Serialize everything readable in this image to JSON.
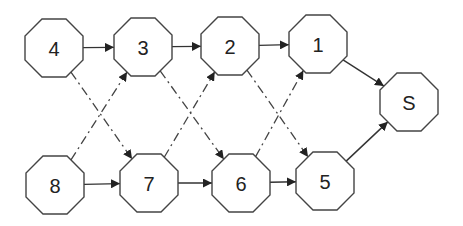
{
  "diagram": {
    "title": "",
    "nodes": [
      {
        "id": "4",
        "label": "4",
        "cx": 54,
        "cy": 48
      },
      {
        "id": "3",
        "label": "3",
        "cx": 143,
        "cy": 47
      },
      {
        "id": "2",
        "label": "2",
        "cx": 230,
        "cy": 46
      },
      {
        "id": "1",
        "label": "1",
        "cx": 318,
        "cy": 44
      },
      {
        "id": "S",
        "label": "S",
        "cx": 409,
        "cy": 102
      },
      {
        "id": "8",
        "label": "8",
        "cx": 55,
        "cy": 185
      },
      {
        "id": "7",
        "label": "7",
        "cx": 149,
        "cy": 183
      },
      {
        "id": "6",
        "label": "6",
        "cx": 241,
        "cy": 183
      },
      {
        "id": "5",
        "label": "5",
        "cx": 325,
        "cy": 181
      }
    ],
    "edges": [
      {
        "from": "4",
        "to": "3",
        "style": "solid"
      },
      {
        "from": "3",
        "to": "2",
        "style": "solid"
      },
      {
        "from": "2",
        "to": "1",
        "style": "solid"
      },
      {
        "from": "1",
        "to": "S",
        "style": "solid"
      },
      {
        "from": "8",
        "to": "7",
        "style": "solid"
      },
      {
        "from": "7",
        "to": "6",
        "style": "solid"
      },
      {
        "from": "6",
        "to": "5",
        "style": "solid"
      },
      {
        "from": "5",
        "to": "S",
        "style": "solid"
      },
      {
        "from": "4",
        "to": "7",
        "style": "dash-dot"
      },
      {
        "from": "3",
        "to": "6",
        "style": "dash-dot"
      },
      {
        "from": "2",
        "to": "5",
        "style": "dash-dot"
      },
      {
        "from": "8",
        "to": "3",
        "style": "dash-dot"
      },
      {
        "from": "7",
        "to": "2",
        "style": "dash-dot"
      },
      {
        "from": "6",
        "to": "1",
        "style": "dash-dot"
      }
    ]
  }
}
